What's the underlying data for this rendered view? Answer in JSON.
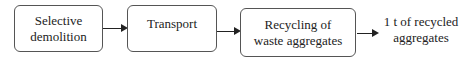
{
  "diagram": {
    "type": "flowchart",
    "direction": "left-to-right",
    "nodes": [
      {
        "id": "n1",
        "label_line1": "Selective",
        "label_line2": "demolition"
      },
      {
        "id": "n2",
        "label_line1": "Transport"
      },
      {
        "id": "n3",
        "label_line1": "Recycling of",
        "label_line2": "waste aggregates"
      },
      {
        "id": "n4",
        "label_line1": "1 t of recycled",
        "label_line2": "aggregates"
      }
    ],
    "edges": [
      {
        "from": "n1",
        "to": "n2"
      },
      {
        "from": "n2",
        "to": "n3"
      },
      {
        "from": "n3",
        "to": "n4"
      }
    ]
  }
}
